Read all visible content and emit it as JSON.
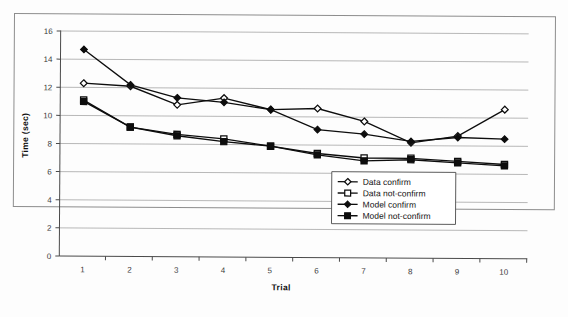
{
  "figure": {
    "background_color": "#fdfdfd",
    "frame_color": "#8d8d8d",
    "ink_color": "#0d0d0d",
    "grid_color": "#9a9a9a"
  },
  "chart_data": {
    "type": "line",
    "title": "",
    "subtitle": "",
    "xlabel": "Trial",
    "ylabel": "Time (sec)",
    "x": [
      1,
      2,
      3,
      4,
      5,
      6,
      7,
      8,
      9,
      10
    ],
    "categories": [
      "1",
      "2",
      "3",
      "4",
      "5",
      "6",
      "7",
      "8",
      "9",
      "10"
    ],
    "xlim": [
      0.5,
      10.5
    ],
    "ylim": [
      0,
      16
    ],
    "ytick_values": [
      0,
      2,
      4,
      6,
      8,
      10,
      12,
      14,
      16
    ],
    "ytick_labels": [
      "0",
      "2",
      "4",
      "6",
      "8",
      "10",
      "12",
      "14",
      "16"
    ],
    "xtick_labels": [
      "1",
      "2",
      "3",
      "4",
      "5",
      "6",
      "7",
      "8",
      "9",
      "10"
    ],
    "grid": true,
    "grid_axis": "y",
    "legend_position": "lower-right-inside",
    "series": [
      {
        "name": "Data confirm",
        "marker": "open-diamond",
        "values": [
          12.3,
          12.1,
          10.8,
          11.3,
          10.5,
          10.6,
          9.7,
          8.2,
          8.7,
          10.6
        ]
      },
      {
        "name": "Data not-confirm",
        "marker": "open-square",
        "values": [
          11.1,
          9.2,
          8.7,
          8.4,
          7.9,
          7.4,
          7.1,
          7.1,
          6.9,
          6.7
        ]
      },
      {
        "name": "Model confirm",
        "marker": "filled-diamond",
        "values": [
          14.7,
          12.2,
          11.3,
          11.0,
          10.5,
          9.1,
          8.8,
          8.3,
          8.6,
          8.5
        ]
      },
      {
        "name": "Model not-confirm",
        "marker": "filled-square",
        "values": [
          11.0,
          9.2,
          8.6,
          8.2,
          7.9,
          7.3,
          6.9,
          7.0,
          6.8,
          6.6
        ]
      }
    ]
  },
  "legend": {
    "items": [
      {
        "label": "Data confirm",
        "marker": "open-diamond"
      },
      {
        "label": "Data not-confirm",
        "marker": "open-square"
      },
      {
        "label": "Model confirm",
        "marker": "filled-diamond"
      },
      {
        "label": "Model not-confirm",
        "marker": "filled-square"
      }
    ]
  }
}
